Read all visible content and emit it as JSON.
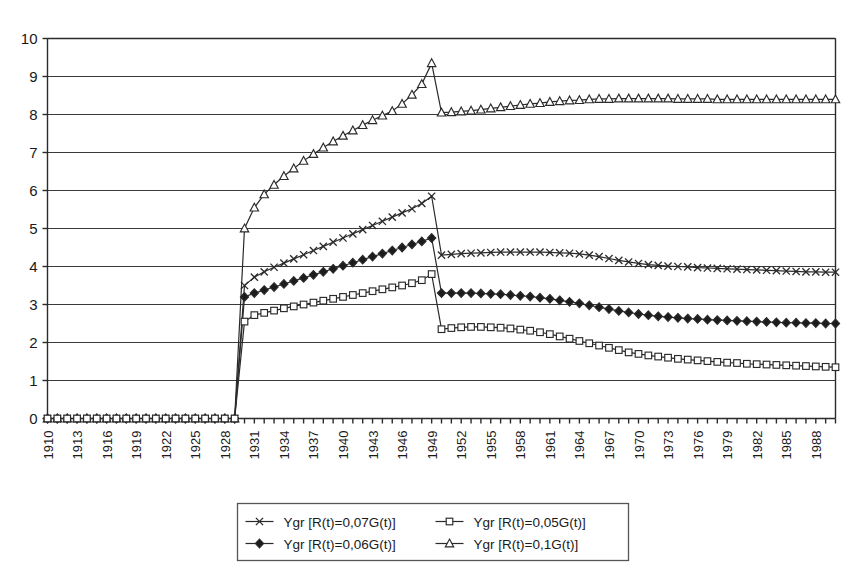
{
  "chart_data": {
    "type": "line",
    "title": "",
    "xlabel": "",
    "ylabel": "",
    "xlim": [
      1910,
      1990
    ],
    "ylim": [
      0,
      10
    ],
    "grid": true,
    "legend_position": "bottom",
    "y_ticks": [
      "0",
      "1",
      "2",
      "3",
      "4",
      "5",
      "6",
      "7",
      "8",
      "9",
      "10"
    ],
    "x_tick_labels": [
      "1910",
      "1913",
      "1916",
      "1919",
      "1922",
      "1925",
      "1928",
      "1931",
      "1934",
      "1937",
      "1940",
      "1943",
      "1946",
      "1949",
      "1952",
      "1955",
      "1958",
      "1961",
      "1964",
      "1967",
      "1970",
      "1973",
      "1976",
      "1979",
      "1982",
      "1985",
      "1988"
    ],
    "x_tick_step": 3,
    "x_minor_step": 1,
    "x": [
      1910,
      1911,
      1912,
      1913,
      1914,
      1915,
      1916,
      1917,
      1918,
      1919,
      1920,
      1921,
      1922,
      1923,
      1924,
      1925,
      1926,
      1927,
      1928,
      1929,
      1930,
      1931,
      1932,
      1933,
      1934,
      1935,
      1936,
      1937,
      1938,
      1939,
      1940,
      1941,
      1942,
      1943,
      1944,
      1945,
      1946,
      1947,
      1948,
      1949,
      1950,
      1951,
      1952,
      1953,
      1954,
      1955,
      1956,
      1957,
      1958,
      1959,
      1960,
      1961,
      1962,
      1963,
      1964,
      1965,
      1966,
      1967,
      1968,
      1969,
      1970,
      1971,
      1972,
      1973,
      1974,
      1975,
      1976,
      1977,
      1978,
      1979,
      1980,
      1981,
      1982,
      1983,
      1984,
      1985,
      1986,
      1987,
      1988,
      1989,
      1990
    ],
    "series": [
      {
        "name": "Ygr [R(t)=0,07G(t)]",
        "marker": "x-cross",
        "marker_fill": "none",
        "values": [
          0,
          0,
          0,
          0,
          0,
          0,
          0,
          0,
          0,
          0,
          0,
          0,
          0,
          0,
          0,
          0,
          0,
          0,
          0,
          0,
          3.5,
          3.72,
          3.86,
          3.98,
          4.09,
          4.2,
          4.31,
          4.42,
          4.53,
          4.64,
          4.75,
          4.86,
          4.97,
          5.08,
          5.19,
          5.3,
          5.41,
          5.52,
          5.66,
          5.85,
          4.3,
          4.32,
          4.34,
          4.35,
          4.36,
          4.37,
          4.38,
          4.38,
          4.38,
          4.38,
          4.38,
          4.37,
          4.36,
          4.35,
          4.33,
          4.3,
          4.26,
          4.21,
          4.16,
          4.12,
          4.08,
          4.05,
          4.03,
          4.01,
          4.0,
          3.99,
          3.97,
          3.96,
          3.95,
          3.94,
          3.93,
          3.92,
          3.91,
          3.9,
          3.89,
          3.88,
          3.87,
          3.86,
          3.86,
          3.85,
          3.85
        ]
      },
      {
        "name": "Ygr [R(t)=0,05G(t)]",
        "marker": "square",
        "marker_fill": "none",
        "values": [
          0,
          0,
          0,
          0,
          0,
          0,
          0,
          0,
          0,
          0,
          0,
          0,
          0,
          0,
          0,
          0,
          0,
          0,
          0,
          0,
          2.55,
          2.72,
          2.78,
          2.84,
          2.9,
          2.95,
          3.0,
          3.05,
          3.1,
          3.15,
          3.2,
          3.25,
          3.3,
          3.35,
          3.4,
          3.45,
          3.5,
          3.56,
          3.64,
          3.8,
          2.35,
          2.38,
          2.4,
          2.41,
          2.41,
          2.4,
          2.39,
          2.37,
          2.34,
          2.31,
          2.27,
          2.22,
          2.16,
          2.1,
          2.04,
          1.98,
          1.92,
          1.86,
          1.8,
          1.74,
          1.7,
          1.66,
          1.63,
          1.6,
          1.57,
          1.55,
          1.53,
          1.51,
          1.49,
          1.47,
          1.46,
          1.44,
          1.43,
          1.42,
          1.41,
          1.4,
          1.39,
          1.38,
          1.37,
          1.36,
          1.35
        ]
      },
      {
        "name": "Ygr [R(t)=0,06G(t)]",
        "marker": "diamond",
        "marker_fill": "solid",
        "values": [
          0,
          0,
          0,
          0,
          0,
          0,
          0,
          0,
          0,
          0,
          0,
          0,
          0,
          0,
          0,
          0,
          0,
          0,
          0,
          0,
          3.2,
          3.3,
          3.38,
          3.46,
          3.54,
          3.62,
          3.7,
          3.78,
          3.86,
          3.94,
          4.02,
          4.1,
          4.18,
          4.26,
          4.34,
          4.42,
          4.5,
          4.58,
          4.66,
          4.75,
          3.3,
          3.3,
          3.3,
          3.3,
          3.29,
          3.28,
          3.27,
          3.25,
          3.23,
          3.21,
          3.18,
          3.15,
          3.11,
          3.07,
          3.03,
          2.98,
          2.93,
          2.88,
          2.83,
          2.79,
          2.75,
          2.72,
          2.69,
          2.67,
          2.65,
          2.63,
          2.62,
          2.6,
          2.59,
          2.58,
          2.57,
          2.56,
          2.55,
          2.54,
          2.53,
          2.52,
          2.52,
          2.51,
          2.51,
          2.5,
          2.5
        ]
      },
      {
        "name": "Ygr [R(t)=0,1G(t)]",
        "marker": "triangle",
        "marker_fill": "none",
        "values": [
          0,
          0,
          0,
          0,
          0,
          0,
          0,
          0,
          0,
          0,
          0,
          0,
          0,
          0,
          0,
          0,
          0,
          0,
          0,
          0,
          5.0,
          5.55,
          5.9,
          6.15,
          6.38,
          6.58,
          6.78,
          6.96,
          7.13,
          7.29,
          7.44,
          7.58,
          7.72,
          7.85,
          7.97,
          8.09,
          8.28,
          8.52,
          8.8,
          9.35,
          8.05,
          8.06,
          8.08,
          8.1,
          8.13,
          8.16,
          8.19,
          8.22,
          8.25,
          8.28,
          8.3,
          8.33,
          8.35,
          8.37,
          8.38,
          8.4,
          8.41,
          8.41,
          8.42,
          8.42,
          8.42,
          8.42,
          8.42,
          8.42,
          8.41,
          8.41,
          8.41,
          8.41,
          8.4,
          8.4,
          8.4,
          8.4,
          8.4,
          8.4,
          8.4,
          8.4,
          8.4,
          8.4,
          8.4,
          8.4,
          8.4
        ]
      }
    ]
  },
  "legend": {
    "entries": [
      {
        "label": "Ygr [R(t)=0,07G(t)]",
        "marker": "x-cross"
      },
      {
        "label": "Ygr [R(t)=0,05G(t)]",
        "marker": "square"
      },
      {
        "label": "Ygr [R(t)=0,06G(t)]",
        "marker": "diamond"
      },
      {
        "label": "Ygr [R(t)=0,1G(t)]",
        "marker": "triangle"
      }
    ]
  },
  "colors": {
    "line": "#2a2a2a",
    "grid": "#3a3a3a",
    "axis": "#2b2b2b",
    "background": "#ffffff",
    "marker_open_fill": "#ffffff",
    "marker_solid_fill": "#1c1c1c"
  }
}
